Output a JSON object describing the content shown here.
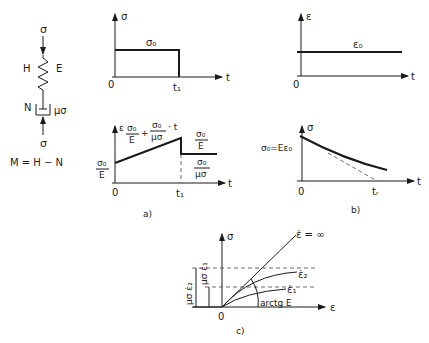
{
  "model": {
    "top_stress": "σ",
    "bottom_stress": "σ",
    "spring_left": "H",
    "spring_right": "E",
    "dashpot_left": "N",
    "dashpot_right": "μσ",
    "equation": "M = H − N"
  },
  "panel_a_top": {
    "y_axis": "σ",
    "x_axis": "t",
    "origin": "0",
    "level_label": "σ₀",
    "t1_label": "t₁"
  },
  "panel_a_bottom": {
    "y_axis": "ε",
    "x_axis": "t",
    "origin": "0",
    "t1_label": "t₁",
    "slope_num_1": "σ₀",
    "slope_den_1": "E",
    "slope_plus": "+",
    "slope_num_2": "σ₀",
    "slope_den_2": "μσ",
    "slope_t": "· t",
    "start_num": "σ₀",
    "start_den": "E",
    "drop_num": "σ₀",
    "drop_den": "E",
    "resid_num": "σ₀",
    "resid_den": "μσ",
    "caption": "a)"
  },
  "panel_b_top": {
    "y_axis": "ε",
    "x_axis": "t",
    "origin": "0",
    "level_label": "ε₀"
  },
  "panel_b_bottom": {
    "y_axis": "σ",
    "x_axis": "t",
    "origin": "0",
    "start_label": "σ₀=Eε₀",
    "tr_label": "tᵣ",
    "caption": "b)"
  },
  "panel_c": {
    "y_axis": "σ",
    "x_axis": "ε",
    "origin": "0",
    "curve_inf": "ε̇ = ∞",
    "curve_2": "ε̇₂",
    "curve_1": "ε̇₁",
    "angle_label": "arctg E",
    "dim_outer": "μσ ε̇₂",
    "dim_inner": "μσ ε̇₁",
    "caption": "c)"
  }
}
